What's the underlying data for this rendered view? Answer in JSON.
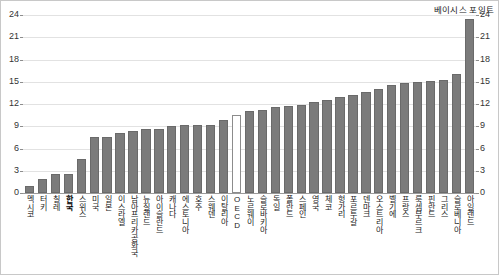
{
  "chart_data": {
    "type": "bar",
    "title": "",
    "subtitle": "",
    "xlabel": "",
    "ylabel": "베이시스 포인트",
    "y_axis_title_right": "베이시스 포인트",
    "ylim": [
      0,
      24
    ],
    "y_ticks": [
      0,
      3,
      6,
      9,
      12,
      15,
      18,
      21,
      24
    ],
    "y_ticks_left": [
      "0",
      "3",
      "6",
      "9",
      "12",
      "15",
      "18",
      "21",
      "24"
    ],
    "y_ticks_right": [
      "0",
      "3",
      "6",
      "9",
      "12",
      "15",
      "18",
      "21",
      "24"
    ],
    "grid": true,
    "legend": "none",
    "dual_axis": true,
    "bar_color": "#7b7b7b",
    "highlight_color": "#ffffff",
    "highlight_category": "OECD",
    "bold_category": "한국",
    "categories": [
      "멕시코",
      "터키",
      "칠레",
      "한국",
      "스위스",
      "미국",
      "일본",
      "이스라엘",
      "남아프리카공화국",
      "뉴질랜드",
      "아이슬란드",
      "캐나다",
      "에스토니아",
      "호주",
      "스웨덴",
      "이탈리아",
      "OECD",
      "노르웨이",
      "슬로바키아",
      "독일",
      "폴란드",
      "스페인",
      "영국",
      "체코",
      "헝가리",
      "포르투갈",
      "덴마크",
      "오스트리아",
      "벨기에",
      "프랑스",
      "룩셈부르크",
      "핀란드",
      "그리스",
      "슬로베니아",
      "아일랜드"
    ],
    "values": [
      1.0,
      1.9,
      2.6,
      2.6,
      4.6,
      7.5,
      7.6,
      8.1,
      8.3,
      8.6,
      8.6,
      9.0,
      9.2,
      9.2,
      9.2,
      9.8,
      10.5,
      11.1,
      11.2,
      11.6,
      11.7,
      11.8,
      12.3,
      12.6,
      12.9,
      13.2,
      13.6,
      14.0,
      14.6,
      14.8,
      15.0,
      15.1,
      15.3,
      16.1,
      23.4
    ]
  }
}
